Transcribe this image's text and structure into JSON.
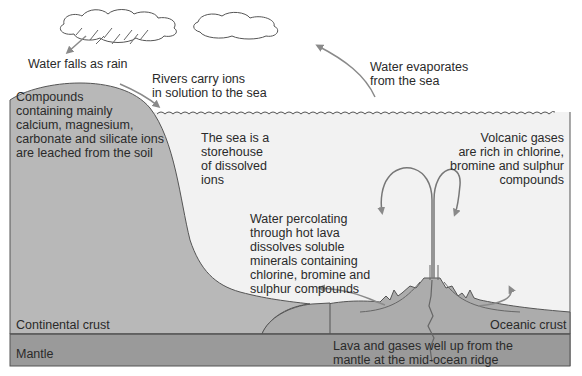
{
  "diagram": {
    "colors": {
      "background": "#ffffff",
      "sea": "#f2f2f2",
      "land": "#b8b8b8",
      "oceanic_crust": "#acacac",
      "mantle": "#9a9a9a",
      "outline": "#555555",
      "arrow": "#8a8a8a",
      "text": "#2a2a2a"
    },
    "labels": {
      "rain": "Water falls as rain",
      "rivers": "Rivers carry ions\nin solution to the sea",
      "evaporation": "Water evaporates\nfrom the sea",
      "leaching": "Compounds\ncontaining mainly\ncalcium, magnesium,\ncarbonate and silicate ions\nare leached from the soil",
      "storehouse": "The sea is a\nstorehouse\nof dissolved\nions",
      "volcanic_gases": "Volcanic gases\nare rich in chlorine,\nbromine and sulphur\ncompounds",
      "percolating": "Water percolating\nthrough hot lava\ndissolves soluble\nminerals containing\nchlorine, bromine and\nsulphur compounds",
      "continental_crust": "Continental crust",
      "oceanic_crust": "Oceanic crust",
      "mantle": "Mantle",
      "lava": "Lava and gases well up from the\nmantle at the mid-ocean ridge"
    },
    "icons": [
      "cloud-icon",
      "rain-streaks-icon",
      "arrow-icon",
      "volcano-icon",
      "wave-icon"
    ]
  }
}
